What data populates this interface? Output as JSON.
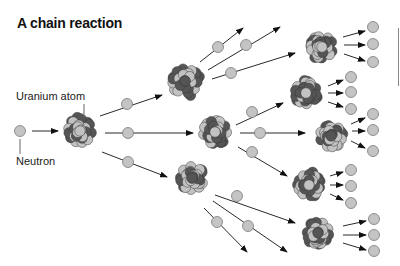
{
  "title": "A chain reaction",
  "labels": {
    "uranium_atom": "Uranium atom",
    "neutron": "Neutron"
  },
  "colors": {
    "neutron_fill": "#c4c4c4",
    "neutron_stroke": "#7a7a7a",
    "proton_dark": "#555555",
    "proton_light": "#c2c2c2",
    "arrow": "#111111"
  },
  "nuclei": [
    {
      "id": "n0",
      "cx": 80,
      "cy": 131,
      "r": 20
    },
    {
      "id": "n1a",
      "cx": 185,
      "cy": 81,
      "r": 21
    },
    {
      "id": "n1b",
      "cx": 215,
      "cy": 132,
      "r": 20
    },
    {
      "id": "n1c",
      "cx": 192,
      "cy": 178,
      "r": 20
    },
    {
      "id": "n2a",
      "cx": 322,
      "cy": 47,
      "r": 19
    },
    {
      "id": "n2b",
      "cx": 306,
      "cy": 93,
      "r": 19
    },
    {
      "id": "n2c",
      "cx": 331,
      "cy": 136,
      "r": 19
    },
    {
      "id": "n2d",
      "cx": 309,
      "cy": 185,
      "r": 19
    },
    {
      "id": "n2e",
      "cx": 318,
      "cy": 233,
      "r": 19
    }
  ],
  "neutrons": [
    {
      "cx": 20,
      "cy": 131
    },
    {
      "cx": 127,
      "cy": 104
    },
    {
      "cx": 128,
      "cy": 133
    },
    {
      "cx": 128,
      "cy": 162
    },
    {
      "cx": 218,
      "cy": 47
    },
    {
      "cx": 246,
      "cy": 45
    },
    {
      "cx": 231,
      "cy": 73
    },
    {
      "cx": 252,
      "cy": 112
    },
    {
      "cx": 260,
      "cy": 133
    },
    {
      "cx": 252,
      "cy": 152
    },
    {
      "cx": 237,
      "cy": 196
    },
    {
      "cx": 217,
      "cy": 222
    },
    {
      "cx": 248,
      "cy": 226
    },
    {
      "cx": 373,
      "cy": 27
    },
    {
      "cx": 373,
      "cy": 44
    },
    {
      "cx": 373,
      "cy": 62
    },
    {
      "cx": 351,
      "cy": 77
    },
    {
      "cx": 351,
      "cy": 92
    },
    {
      "cx": 351,
      "cy": 109
    },
    {
      "cx": 373,
      "cy": 114
    },
    {
      "cx": 373,
      "cy": 130
    },
    {
      "cx": 373,
      "cy": 151
    },
    {
      "cx": 351,
      "cy": 170
    },
    {
      "cx": 351,
      "cy": 186
    },
    {
      "cx": 351,
      "cy": 203
    },
    {
      "cx": 374,
      "cy": 219
    },
    {
      "cx": 374,
      "cy": 235
    },
    {
      "cx": 374,
      "cy": 251
    }
  ],
  "arrows": [
    {
      "x1": 32,
      "y1": 131,
      "x2": 58,
      "y2": 131
    },
    {
      "x1": 100,
      "y1": 116,
      "x2": 162,
      "y2": 95
    },
    {
      "x1": 105,
      "y1": 133,
      "x2": 193,
      "y2": 133
    },
    {
      "x1": 102,
      "y1": 152,
      "x2": 167,
      "y2": 177
    },
    {
      "x1": 200,
      "y1": 62,
      "x2": 243,
      "y2": 28
    },
    {
      "x1": 208,
      "y1": 70,
      "x2": 280,
      "y2": 27
    },
    {
      "x1": 212,
      "y1": 79,
      "x2": 295,
      "y2": 53
    },
    {
      "x1": 236,
      "y1": 125,
      "x2": 283,
      "y2": 103
    },
    {
      "x1": 240,
      "y1": 133,
      "x2": 305,
      "y2": 133
    },
    {
      "x1": 238,
      "y1": 147,
      "x2": 287,
      "y2": 176
    },
    {
      "x1": 215,
      "y1": 195,
      "x2": 295,
      "y2": 223
    },
    {
      "x1": 204,
      "y1": 208,
      "x2": 247,
      "y2": 252
    },
    {
      "x1": 213,
      "y1": 201,
      "x2": 287,
      "y2": 252
    },
    {
      "x1": 343,
      "y1": 37,
      "x2": 365,
      "y2": 31
    },
    {
      "x1": 344,
      "y1": 45,
      "x2": 365,
      "y2": 45
    },
    {
      "x1": 344,
      "y1": 54,
      "x2": 365,
      "y2": 61
    },
    {
      "x1": 328,
      "y1": 86,
      "x2": 343,
      "y2": 80
    },
    {
      "x1": 328,
      "y1": 93,
      "x2": 343,
      "y2": 93
    },
    {
      "x1": 328,
      "y1": 102,
      "x2": 343,
      "y2": 107
    },
    {
      "x1": 351,
      "y1": 124,
      "x2": 365,
      "y2": 118
    },
    {
      "x1": 352,
      "y1": 131,
      "x2": 365,
      "y2": 131
    },
    {
      "x1": 351,
      "y1": 141,
      "x2": 365,
      "y2": 148
    },
    {
      "x1": 330,
      "y1": 176,
      "x2": 343,
      "y2": 172
    },
    {
      "x1": 330,
      "y1": 185,
      "x2": 343,
      "y2": 185
    },
    {
      "x1": 330,
      "y1": 194,
      "x2": 343,
      "y2": 200
    },
    {
      "x1": 343,
      "y1": 226,
      "x2": 366,
      "y2": 221
    },
    {
      "x1": 343,
      "y1": 235,
      "x2": 366,
      "y2": 235
    },
    {
      "x1": 343,
      "y1": 243,
      "x2": 366,
      "y2": 250
    }
  ],
  "leader_lines": [
    {
      "x1": 84,
      "y1": 104,
      "x2": 84,
      "y2": 114
    },
    {
      "x1": 20,
      "y1": 139,
      "x2": 20,
      "y2": 154
    }
  ]
}
